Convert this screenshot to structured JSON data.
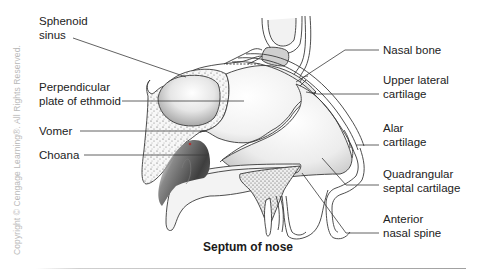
{
  "figure": {
    "caption": "Septum of nose",
    "copyright": "Copyright © Cengage Learning®. All Rights Reserved."
  },
  "labels_left": [
    {
      "id": "sphenoid-sinus",
      "lines": [
        "Sphenoid",
        "sinus"
      ]
    },
    {
      "id": "perpendicular-plate",
      "lines": [
        "Perpendicular",
        "plate of ethmoid"
      ]
    },
    {
      "id": "vomer",
      "lines": [
        "Vomer"
      ]
    },
    {
      "id": "choana",
      "lines": [
        "Choana"
      ]
    }
  ],
  "labels_right": [
    {
      "id": "nasal-bone",
      "lines": [
        "Nasal bone"
      ]
    },
    {
      "id": "upper-lateral-cartilage",
      "lines": [
        "Upper lateral",
        "cartilage"
      ]
    },
    {
      "id": "alar-cartilage",
      "lines": [
        "Alar",
        "cartilage"
      ]
    },
    {
      "id": "quadrangular-septal-cartilage",
      "lines": [
        "Quadrangular",
        "septal cartilage"
      ]
    },
    {
      "id": "anterior-nasal-spine",
      "lines": [
        "Anterior",
        "nasal spine"
      ]
    }
  ],
  "colors": {
    "line": "#3a3a3a",
    "text": "#222222",
    "copyright": "#b9b9b9",
    "cavity_dark": "#4a4a4a",
    "stipple": "#555555"
  }
}
